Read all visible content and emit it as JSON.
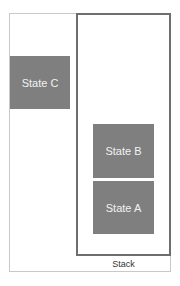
{
  "diagram": {
    "type": "stack-illustration",
    "outside_states": [
      {
        "label": "State C",
        "color": "#7f7f7f"
      }
    ],
    "stack": {
      "label": "Stack",
      "border_color": "#6e6e6e",
      "items_top_to_bottom": [
        {
          "label": "State B",
          "color": "#7f7f7f"
        },
        {
          "label": "State A",
          "color": "#7f7f7f"
        }
      ]
    },
    "colors": {
      "state_fill": "#7f7f7f",
      "state_text": "#f2f2f2",
      "outer_border": "#c8c8c8",
      "stack_border": "#6e6e6e"
    }
  }
}
